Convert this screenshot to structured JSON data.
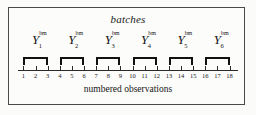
{
  "figure": {
    "title": "batches",
    "caption": "numbered observations",
    "frame_color": "#4a4a4a",
    "background_color": "#fcfcfb",
    "ink_color": "#111111"
  },
  "batches": [
    {
      "base": "Y",
      "subscript": "1",
      "superscript": "bm",
      "observations": [
        1,
        2,
        3
      ]
    },
    {
      "base": "Y",
      "subscript": "2",
      "superscript": "bm",
      "observations": [
        4,
        5,
        6
      ]
    },
    {
      "base": "Y",
      "subscript": "3",
      "superscript": "bm",
      "observations": [
        7,
        8,
        9
      ]
    },
    {
      "base": "Y",
      "subscript": "4",
      "superscript": "bm",
      "observations": [
        10,
        11,
        12
      ]
    },
    {
      "base": "Y",
      "subscript": "5",
      "superscript": "bm",
      "observations": [
        13,
        14,
        15
      ]
    },
    {
      "base": "Y",
      "subscript": "6",
      "superscript": "bm",
      "observations": [
        16,
        17,
        18
      ]
    }
  ],
  "axis": {
    "label": "numbered observations",
    "ticks": [
      1,
      2,
      3,
      4,
      5,
      6,
      7,
      8,
      9,
      10,
      11,
      12,
      13,
      14,
      15,
      16,
      17,
      18
    ],
    "min": 1,
    "max": 18,
    "batch_size": 3,
    "batch_count": 6
  },
  "chart_data": {
    "type": "diagram",
    "title": "batches",
    "xlabel": "numbered observations",
    "ylabel": "",
    "categories": [
      "Y_1^bm",
      "Y_2^bm",
      "Y_3^bm",
      "Y_4^bm",
      "Y_5^bm",
      "Y_6^bm"
    ],
    "groups": [
      {
        "name": "Y_1^bm",
        "observations": [
          1,
          2,
          3
        ]
      },
      {
        "name": "Y_2^bm",
        "observations": [
          4,
          5,
          6
        ]
      },
      {
        "name": "Y_3^bm",
        "observations": [
          7,
          8,
          9
        ]
      },
      {
        "name": "Y_4^bm",
        "observations": [
          10,
          11,
          12
        ]
      },
      {
        "name": "Y_5^bm",
        "observations": [
          13,
          14,
          15
        ]
      },
      {
        "name": "Y_6^bm",
        "observations": [
          16,
          17,
          18
        ]
      }
    ],
    "tick_labels": [
      "1",
      "2",
      "3",
      "4",
      "5",
      "6",
      "7",
      "8",
      "9",
      "10",
      "11",
      "12",
      "13",
      "14",
      "15",
      "16",
      "17",
      "18"
    ],
    "xlim": [
      1,
      18
    ],
    "grid": false,
    "legend": "none"
  }
}
